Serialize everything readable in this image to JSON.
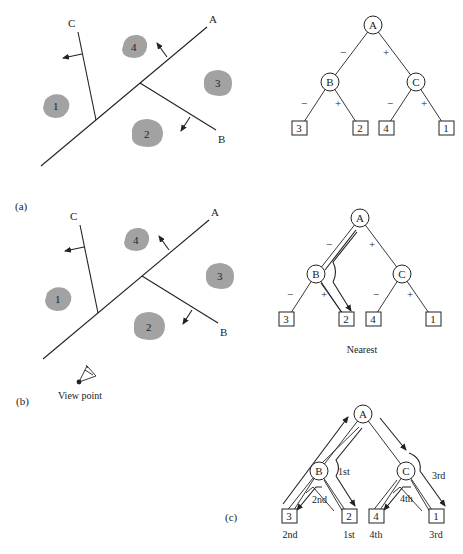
{
  "figure_a": {
    "panel_label": "(a)",
    "partitions": {
      "A": "A",
      "B": "B",
      "C": "C"
    },
    "regions": [
      "1",
      "2",
      "3",
      "4"
    ],
    "tree": {
      "root": "A",
      "internal": [
        "B",
        "C"
      ],
      "edge_labels": {
        "A_B": "−",
        "A_C": "+",
        "B_3": "−",
        "B_2": "+",
        "C_4": "−",
        "C_1": "+"
      },
      "leaves": [
        "3",
        "2",
        "4",
        "1"
      ]
    }
  },
  "figure_b": {
    "panel_label": "(b)",
    "partitions": {
      "A": "A",
      "B": "B",
      "C": "C"
    },
    "regions": [
      "1",
      "2",
      "3",
      "4"
    ],
    "view_point_label": "View point",
    "tree": {
      "root": "A",
      "internal": [
        "B",
        "C"
      ],
      "edge_labels": {
        "A_B": "−",
        "A_C": "+",
        "B_3": "−",
        "B_2": "+",
        "C_4": "−",
        "C_1": "+"
      },
      "leaves": [
        "3",
        "2",
        "4",
        "1"
      ]
    },
    "caption": "Nearest"
  },
  "figure_c": {
    "panel_label": "(c)",
    "tree": {
      "root": "A",
      "internal": [
        "B",
        "C"
      ],
      "leaves": [
        "3",
        "2",
        "4",
        "1"
      ]
    },
    "traversal_labels": {
      "B_side": "1st",
      "B_to_3": "2nd",
      "C_side": "3rd",
      "C_to_4": "4th"
    },
    "leaf_order": [
      "2nd",
      "1st",
      "4th",
      "3rd"
    ]
  }
}
